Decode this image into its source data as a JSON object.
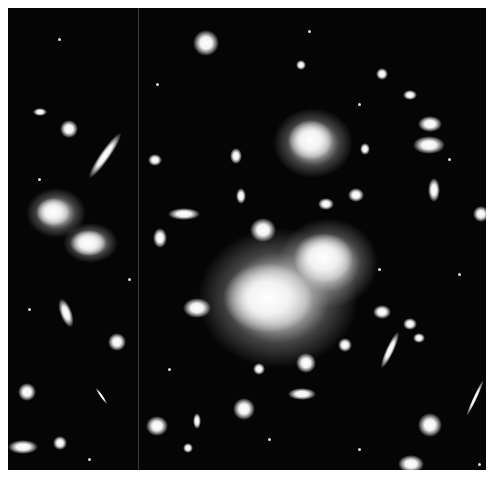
{
  "image": {
    "description": "Black-and-white astronomical image of a rich galaxy cluster with bright central elliptical galaxies, many small elliptical and spiral galaxies, and elongated gravitationally lensed arcs, framed by a thin white border",
    "background_color": "#050505",
    "border_color": "#ffffff",
    "objects": [
      {
        "type": "cluster-core",
        "x": 265,
        "y": 295,
        "w": 130,
        "h": 100
      },
      {
        "type": "bright-galaxy",
        "x": 320,
        "y": 255,
        "w": 80,
        "h": 70
      },
      {
        "type": "bright-galaxy",
        "x": 307,
        "y": 140,
        "w": 70,
        "h": 60
      },
      {
        "type": "bright-galaxy",
        "x": 48,
        "y": 212,
        "w": 50,
        "h": 45
      },
      {
        "type": "bright-galaxy",
        "x": 85,
        "y": 240,
        "w": 50,
        "h": 40
      },
      {
        "type": "bright-galaxy",
        "x": 205,
        "y": 35,
        "w": 30,
        "h": 28
      },
      {
        "type": "lensed-arc",
        "x": 110,
        "y": 155,
        "w": 12,
        "h": 55,
        "angle": 35
      },
      {
        "type": "lensed-arc",
        "x": 393,
        "y": 345,
        "w": 8,
        "h": 40,
        "angle": 25
      },
      {
        "type": "lensed-arc",
        "x": 68,
        "y": 310,
        "w": 10,
        "h": 30,
        "angle": -15
      }
    ]
  }
}
